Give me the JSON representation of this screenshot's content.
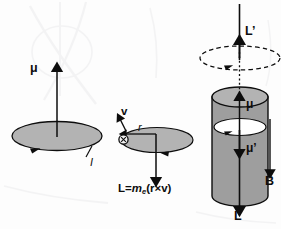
{
  "figure": {
    "background_color": "#fdfdfd",
    "ink_color": "#0d0d0d",
    "fill_gray": "#b3b3b3",
    "fill_gray_dark": "#9e9e9e",
    "fill_white": "#ffffff"
  },
  "panels": {
    "left": {
      "name": "current-loop-panel",
      "labels": {
        "mu": "μ",
        "current": "I"
      }
    },
    "middle": {
      "name": "orbiting-electron-panel",
      "labels": {
        "velocity": "v",
        "radius": "r",
        "electron": "−"
      },
      "formula": {
        "lhs": "L",
        "equals": "=",
        "mass": "m",
        "mass_subscript": "e",
        "open_paren": "(",
        "r": "r",
        "cross": "×",
        "v": "v",
        "close_paren": ")",
        "full_text": "L = m_e(r × v)"
      }
    },
    "right": {
      "name": "precessing-cylinder-panel",
      "labels": {
        "angular_momentum_precess": "L’",
        "mu_up": "μ",
        "mu_prime_down": "μ’",
        "magnetic_field": "B",
        "angular_momentum_down": "L"
      }
    }
  }
}
